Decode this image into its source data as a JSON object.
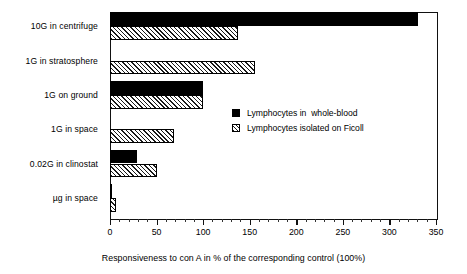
{
  "chart_data": {
    "type": "bar",
    "orientation": "horizontal",
    "title": "",
    "xlabel": "Responsiveness to con A in % of the corresponding control (100%)",
    "ylabel": "",
    "xlim": [
      0,
      350
    ],
    "xticks": [
      0,
      50,
      100,
      150,
      200,
      250,
      300,
      350
    ],
    "xtick_labels": [
      "0",
      "50",
      "100",
      "150",
      "200",
      "250",
      "300",
      "350"
    ],
    "grid": false,
    "legend_position": "center-right",
    "categories": [
      "10G in centrifuge",
      "1G  in stratosphere",
      "1G on ground",
      "1G in space",
      "0.02G in clinostat",
      "µg in space"
    ],
    "series": [
      {
        "name": "Lymphocytes in  whole-blood",
        "style": "solid-black",
        "values": [
          331,
          0,
          100,
          0,
          29,
          2
        ]
      },
      {
        "name": "Lymphocytes isolated on Ficoll",
        "style": "hatched",
        "values": [
          137,
          156,
          100,
          69,
          50,
          6
        ]
      }
    ]
  },
  "legend": {
    "items": [
      {
        "label": "Lymphocytes in  whole-blood",
        "swatch": "solid-black"
      },
      {
        "label": "Lymphocytes isolated on Ficoll",
        "swatch": "hatched"
      }
    ]
  },
  "colors": {
    "series_solid": "#000000",
    "series_hatch_line": "#1a1a1a",
    "axis": "#111111",
    "background": "#ffffff"
  }
}
